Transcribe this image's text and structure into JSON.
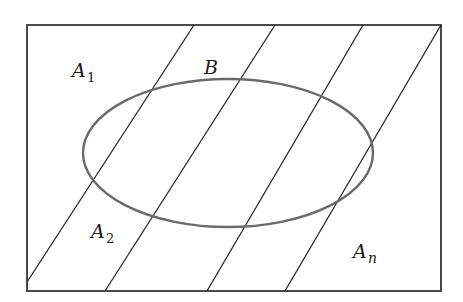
{
  "diagram": {
    "frame": {
      "x": 27,
      "y": 25,
      "width": 414,
      "height": 266
    },
    "ellipse": {
      "label": "B",
      "cx": 228,
      "cy": 153,
      "rx": 145,
      "ry": 74
    },
    "partition_lines": [
      {
        "x1": 27,
        "y1": 282,
        "x2": 194,
        "y2": 25
      },
      {
        "x1": 105,
        "y1": 291,
        "x2": 275,
        "y2": 25
      },
      {
        "x1": 207,
        "y1": 291,
        "x2": 363,
        "y2": 25
      },
      {
        "x1": 285,
        "y1": 291,
        "x2": 441,
        "y2": 25
      }
    ],
    "labels": {
      "a1": {
        "main": "A",
        "sub": "1"
      },
      "b": {
        "main": "B"
      },
      "a2": {
        "main": "A",
        "sub": "2"
      },
      "an": {
        "main": "A",
        "sub": "n"
      }
    },
    "colors": {
      "frame": "#4a4a4a",
      "lines": "#262626",
      "ellipse": "#6a6a6a",
      "text": "#1a1a1a"
    }
  }
}
